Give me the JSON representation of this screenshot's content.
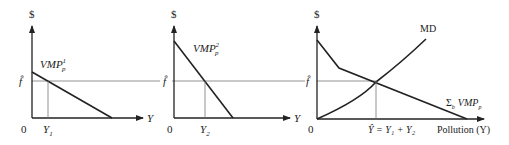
{
  "panels": [
    {
      "id": "panel-1",
      "y_axis_label": "$",
      "x_axis_label": "Y",
      "origin_label": "0",
      "fhat_label": "f̂",
      "curve_label_main": "VMP",
      "curve_label_sub": "p",
      "curve_label_sup": "1",
      "quantity_label_main": "Y",
      "quantity_label_sub": "1"
    },
    {
      "id": "panel-2",
      "y_axis_label": "$",
      "x_axis_label": "Y",
      "origin_label": "0",
      "fhat_label": "f̂",
      "curve_label_main": "VMP",
      "curve_label_sub": "p",
      "curve_label_sup": "2",
      "quantity_label_main": "Y",
      "quantity_label_sub": "2"
    },
    {
      "id": "panel-3",
      "y_axis_label": "$",
      "x_axis_label": "Pollution (Y)",
      "origin_label": "0",
      "fhat_label": "f̂",
      "md_label": "MD",
      "sum_label_sigma": "Σ",
      "sum_label_sigma_sub": "b",
      "sum_label_main": "VMP",
      "sum_label_sub": "p",
      "equilibrium_label": "Ŷ = Y₁ + Y₂"
    }
  ],
  "colors": {
    "line": "#222222",
    "guide": "#777777",
    "background": "#ffffff"
  }
}
